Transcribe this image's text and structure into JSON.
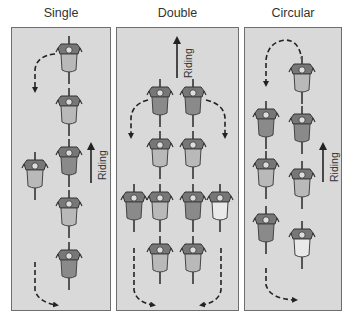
{
  "panels": [
    {
      "id": "single",
      "title": "Single",
      "x": 11,
      "width": 100,
      "riding_label": "Riding",
      "riders": [
        {
          "x": 69,
          "y": 60,
          "shade": "light"
        },
        {
          "x": 69,
          "y": 112,
          "shade": "light"
        },
        {
          "x": 69,
          "y": 163,
          "shade": "dark"
        },
        {
          "x": 35,
          "y": 176,
          "shade": "light"
        },
        {
          "x": 69,
          "y": 214,
          "shade": "light"
        },
        {
          "x": 69,
          "y": 266,
          "shade": "dark"
        }
      ]
    },
    {
      "id": "double",
      "title": "Double",
      "x": 116,
      "width": 123,
      "riding_label": "Riding",
      "riders": [
        {
          "x": 160,
          "y": 103,
          "shade": "dark"
        },
        {
          "x": 193,
          "y": 103,
          "shade": "dark"
        },
        {
          "x": 160,
          "y": 155,
          "shade": "light"
        },
        {
          "x": 193,
          "y": 155,
          "shade": "light"
        },
        {
          "x": 134,
          "y": 208,
          "shade": "dark"
        },
        {
          "x": 160,
          "y": 208,
          "shade": "light"
        },
        {
          "x": 193,
          "y": 208,
          "shade": "dark"
        },
        {
          "x": 220,
          "y": 208,
          "shade": "white"
        },
        {
          "x": 160,
          "y": 260,
          "shade": "light"
        },
        {
          "x": 193,
          "y": 260,
          "shade": "light"
        }
      ]
    },
    {
      "id": "circular",
      "title": "Circular",
      "x": 244,
      "width": 98,
      "riding_label": "Riding",
      "riders": [
        {
          "x": 302,
          "y": 80,
          "shade": "light"
        },
        {
          "x": 266,
          "y": 125,
          "shade": "dark"
        },
        {
          "x": 302,
          "y": 130,
          "shade": "dark"
        },
        {
          "x": 266,
          "y": 175,
          "shade": "light"
        },
        {
          "x": 302,
          "y": 185,
          "shade": "light"
        },
        {
          "x": 266,
          "y": 230,
          "shade": "dark"
        },
        {
          "x": 302,
          "y": 245,
          "shade": "white"
        }
      ]
    }
  ],
  "colors": {
    "panel_bg": "#d9d9d9",
    "panel_border": "#6e6e6e",
    "arrow": "#222222",
    "rider_dark": "#8a8a8a",
    "rider_light": "#b9b9b9",
    "rider_white": "#e9e9e9"
  }
}
